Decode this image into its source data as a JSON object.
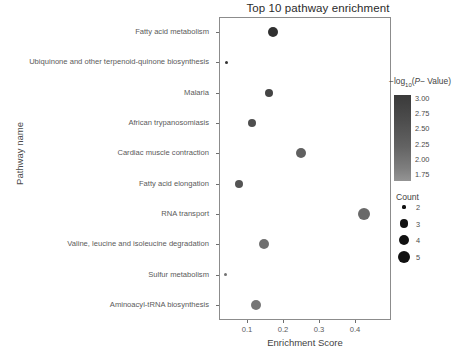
{
  "chart_data": {
    "type": "scatter",
    "title": "Top 10 pathway enrichment",
    "xlabel": "Enrichment Score",
    "ylabel": "Pathway name",
    "xlim": [
      0.0,
      0.47
    ],
    "xticks": [
      0.1,
      0.2,
      0.3,
      0.4
    ],
    "xtick_labels": [
      "0.1",
      "0.2",
      "0.3",
      "0.4"
    ],
    "grid": false,
    "categories": [
      "Fatty acid metabolism",
      "Ubiquinone and other terpenoid-quinone biosynthesis",
      "Malaria",
      "African trypanosomiasis",
      "Cardiac muscle contraction",
      "Fatty acid elongation",
      "RNA transport",
      "Valine, leucine and isoleucine degradation",
      "Sulfur metabolism",
      "Aminoacyl-tRNA biosynthesis"
    ],
    "points": [
      {
        "pathway": "Fatty acid metabolism",
        "enrichment_score": 0.172,
        "count": 4,
        "neglog10_p": 2.95
      },
      {
        "pathway": "Ubiquinone and other terpenoid-quinone biosynthesis",
        "enrichment_score": 0.043,
        "count": 2,
        "neglog10_p": 2.9
      },
      {
        "pathway": "Malaria",
        "enrichment_score": 0.161,
        "count": 3,
        "neglog10_p": 2.6
      },
      {
        "pathway": "African trypanosomiasis",
        "enrichment_score": 0.114,
        "count": 3,
        "neglog10_p": 2.45
      },
      {
        "pathway": "Cardiac muscle contraction",
        "enrichment_score": 0.25,
        "count": 4,
        "neglog10_p": 2.15
      },
      {
        "pathway": "Fatty acid elongation",
        "enrichment_score": 0.078,
        "count": 3,
        "neglog10_p": 2.35
      },
      {
        "pathway": "RNA transport",
        "enrichment_score": 0.425,
        "count": 5,
        "neglog10_p": 2.0
      },
      {
        "pathway": "Valine, leucine and isoleucine degradation",
        "enrichment_score": 0.147,
        "count": 4,
        "neglog10_p": 1.9
      },
      {
        "pathway": "Sulfur metabolism",
        "enrichment_score": 0.04,
        "count": 2,
        "neglog10_p": 1.85
      },
      {
        "pathway": "Aminoacyl-tRNA biosynthesis",
        "enrichment_score": 0.124,
        "count": 4,
        "neglog10_p": 1.8
      }
    ],
    "legends": {
      "color": {
        "title_prefix": "−log",
        "title_sub": "10",
        "title_mid": "(",
        "title_italic": "P",
        "title_suffix": "− Value)",
        "ticks": [
          "3.00",
          "2.75",
          "2.50",
          "2.25",
          "2.00",
          "1.75"
        ],
        "vmax": 3.0,
        "vmin": 1.75,
        "position": "right"
      },
      "size": {
        "title": "Count",
        "values": [
          "2",
          "3",
          "4",
          "5"
        ],
        "position": "right"
      }
    },
    "colors": {
      "point_dark": "#333333",
      "point_mid": "#555555",
      "point_light": "#7a7a7a",
      "panel_border": "#8c8c8c",
      "text": "#4a4a4a",
      "background": "#ffffff"
    }
  }
}
